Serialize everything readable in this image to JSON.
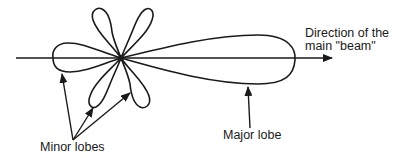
{
  "diagram": {
    "type": "antenna radiation pattern",
    "stroke_color": "#1a1a1a",
    "labels": {
      "direction_line1": "Direction of the",
      "direction_line2": "main \"beam\"",
      "major_lobe": "Major lobe",
      "minor_lobes": "Minor lobes"
    },
    "elements": {
      "axis": "horizontal line with arrow",
      "major_lobe_count": 1,
      "minor_lobe_count": 5
    }
  }
}
